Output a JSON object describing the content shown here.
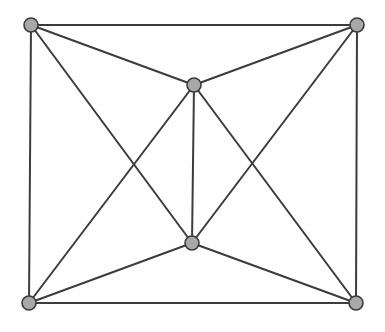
{
  "figure": {
    "kind": "undirected-graph-diagram",
    "title": "",
    "caption": "",
    "background_color": "#fefefe",
    "canvas": {
      "width": 385,
      "height": 332
    }
  },
  "style": {
    "edge_color": "#3c3c3c",
    "edge_width": 2,
    "vertex_fill": "#a8a8a8",
    "vertex_stroke": "#3a3a3a",
    "vertex_stroke_width": 1.6,
    "vertex_radius": 7
  },
  "graph_data": {
    "type": "graph",
    "directed": false,
    "vertex_count": 6,
    "edge_count": 13,
    "vertices": [
      {
        "id": "top-left",
        "label": "",
        "x": 31,
        "y": 25,
        "degree": 4
      },
      {
        "id": "top-right",
        "label": "",
        "x": 357,
        "y": 25,
        "degree": 4
      },
      {
        "id": "middle-upper",
        "label": "",
        "x": 194,
        "y": 85,
        "degree": 5
      },
      {
        "id": "middle-lower",
        "label": "",
        "x": 192,
        "y": 243,
        "degree": 5
      },
      {
        "id": "bottom-left",
        "label": "",
        "x": 29,
        "y": 303,
        "degree": 4
      },
      {
        "id": "bottom-right",
        "label": "",
        "x": 356,
        "y": 303,
        "degree": 4
      }
    ],
    "edges": [
      {
        "id": "e1",
        "source": "top-left",
        "target": "top-right"
      },
      {
        "id": "e2",
        "source": "top-left",
        "target": "bottom-left"
      },
      {
        "id": "e3",
        "source": "top-right",
        "target": "bottom-right"
      },
      {
        "id": "e4",
        "source": "bottom-left",
        "target": "bottom-right"
      },
      {
        "id": "e5",
        "source": "top-left",
        "target": "middle-upper"
      },
      {
        "id": "e6",
        "source": "top-right",
        "target": "middle-upper"
      },
      {
        "id": "e7",
        "source": "top-left",
        "target": "middle-lower"
      },
      {
        "id": "e8",
        "source": "top-right",
        "target": "middle-lower"
      },
      {
        "id": "e9",
        "source": "bottom-left",
        "target": "middle-upper"
      },
      {
        "id": "e10",
        "source": "bottom-right",
        "target": "middle-upper"
      },
      {
        "id": "e11",
        "source": "bottom-left",
        "target": "middle-lower"
      },
      {
        "id": "e12",
        "source": "bottom-right",
        "target": "middle-lower"
      },
      {
        "id": "e13",
        "source": "middle-upper",
        "target": "middle-lower"
      }
    ]
  }
}
